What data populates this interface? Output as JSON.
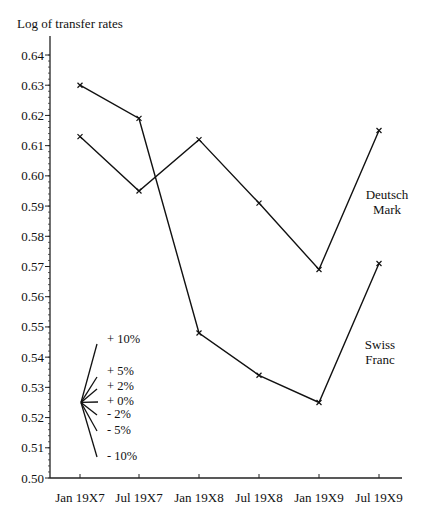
{
  "chart_data": {
    "type": "line",
    "title": "",
    "ylabel": "Log of transfer rates",
    "xlabel": "",
    "categories": [
      "Jan 19X7",
      "Jul 19X7",
      "Jan 19X8",
      "Jul 19X8",
      "Jan 19X9",
      "Jul 19X9"
    ],
    "series": [
      {
        "name": "Deutsch Mark",
        "values": [
          0.613,
          0.595,
          0.612,
          0.591,
          0.569,
          0.615
        ]
      },
      {
        "name": "Swiss Franc",
        "values": [
          0.63,
          0.619,
          0.548,
          0.534,
          0.525,
          0.571
        ]
      }
    ],
    "ylim": [
      0.5,
      0.64
    ],
    "yticks": [
      "0.50",
      "0.51",
      "0.52",
      "0.53",
      "0.54",
      "0.55",
      "0.56",
      "0.57",
      "0.58",
      "0.59",
      "0.60",
      "0.61",
      "0.62",
      "0.63",
      "0.64"
    ],
    "grid": false,
    "legend": "inline labels at right",
    "annotations": {
      "series_labels": [
        {
          "series": "Deutsch Mark",
          "lines": [
            "Deutsch",
            "Mark"
          ]
        },
        {
          "series": "Swiss Franc",
          "lines": [
            "Swiss",
            "Franc"
          ]
        }
      ],
      "growth_fan": {
        "origin_value": 0.525,
        "labels": [
          "+ 10%",
          "+ 5%",
          "+ 2%",
          "+ 0%",
          "- 2%",
          "- 5%",
          "- 10%"
        ]
      }
    }
  },
  "labels": {
    "ylabel": "Log of transfer rates",
    "dm_line1": "Deutsch",
    "dm_line2": "Mark",
    "sf_line1": "Swiss",
    "sf_line2": "Franc",
    "fan": [
      "+ 10%",
      "+ 5%",
      "+ 2%",
      "+ 0%",
      "- 2%",
      "- 5%",
      "- 10%"
    ]
  }
}
